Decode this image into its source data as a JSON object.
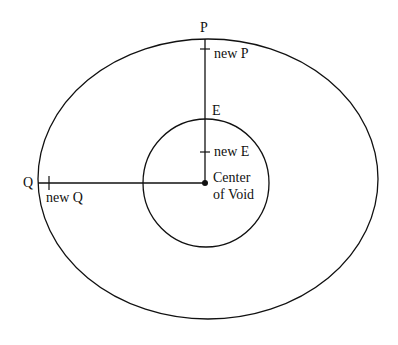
{
  "diagram": {
    "colors": {
      "stroke": "#111111",
      "background": "#ffffff"
    },
    "outer_circle": {
      "cx": 208,
      "cy": 179,
      "rx": 170,
      "ry": 140
    },
    "inner_circle": {
      "cx": 206,
      "cy": 183,
      "rx": 63,
      "ry": 64
    },
    "center_point": {
      "x": 205,
      "y": 183
    },
    "labels": {
      "p": "P",
      "new_p": "new P",
      "e": "E",
      "new_e": "new E",
      "q": "Q",
      "new_q": "new Q",
      "center_line1": "Center",
      "center_line2": "of Void"
    }
  }
}
